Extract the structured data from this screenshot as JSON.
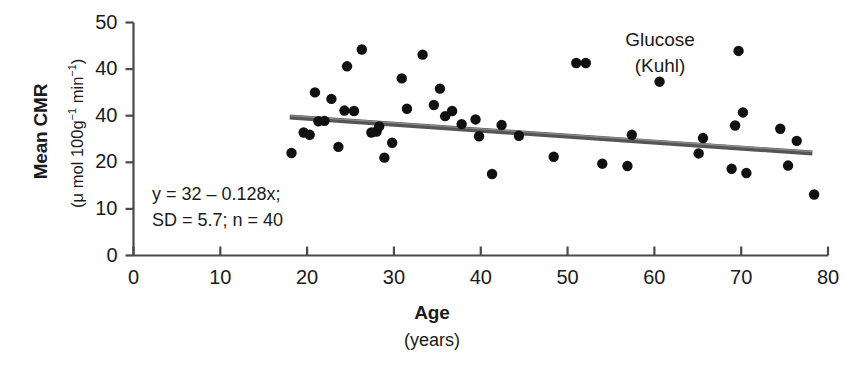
{
  "chart_data": {
    "type": "scatter",
    "title": "Glucose",
    "subtitle": "(Kuhl)",
    "xlabel": "Age",
    "xlabel_units": "(years)",
    "ylabel": "Mean CMR",
    "ylabel_units_prefix": "(μ mol 100g",
    "ylabel_units_sup1": "−1",
    "ylabel_units_mid": " min",
    "ylabel_units_sup2": "−1",
    "ylabel_units_suffix": ")",
    "xlim": [
      0,
      80
    ],
    "ylim": [
      0,
      50
    ],
    "xticks": [
      0,
      10,
      20,
      30,
      40,
      50,
      60,
      70,
      80
    ],
    "xtick_labels": [
      "0",
      "10",
      "20",
      "30",
      "40",
      "50",
      "60",
      "70",
      "80"
    ],
    "yticks": [
      0,
      10,
      20,
      30,
      40,
      50
    ],
    "ytick_labels": [
      "0",
      "10",
      "20",
      "40",
      "40",
      "50"
    ],
    "grid": false,
    "legend": "none",
    "marker_color": "#111111",
    "marker_size": 5.2,
    "axis_color": "#4a4a4a",
    "fit_line": {
      "label": "regression line",
      "color": "#555555",
      "width": 5,
      "x_start": 18,
      "x_end": 78.2,
      "y_start": 29.7,
      "y_end": 22.0
    },
    "annotations": {
      "equation": "y = 32 – 0.128x;",
      "statistics": "SD = 5.7; n = 40"
    },
    "n_points": 40,
    "points": [
      [
        18.2,
        22.0
      ],
      [
        19.6,
        26.4
      ],
      [
        20.3,
        25.9
      ],
      [
        20.9,
        35.0
      ],
      [
        21.3,
        28.8
      ],
      [
        22.0,
        28.9
      ],
      [
        22.8,
        33.6
      ],
      [
        23.6,
        23.3
      ],
      [
        24.3,
        31.1
      ],
      [
        24.6,
        40.6
      ],
      [
        25.4,
        31.0
      ],
      [
        26.3,
        44.2
      ],
      [
        27.4,
        26.4
      ],
      [
        28.0,
        26.6
      ],
      [
        28.3,
        27.7
      ],
      [
        28.9,
        21.0
      ],
      [
        29.8,
        24.2
      ],
      [
        30.9,
        38.0
      ],
      [
        31.5,
        31.5
      ],
      [
        33.3,
        43.1
      ],
      [
        34.6,
        32.3
      ],
      [
        35.3,
        35.8
      ],
      [
        35.9,
        29.9
      ],
      [
        36.7,
        31.0
      ],
      [
        37.8,
        28.2
      ],
      [
        39.4,
        29.2
      ],
      [
        39.8,
        25.6
      ],
      [
        41.3,
        17.5
      ],
      [
        42.4,
        28.0
      ],
      [
        44.4,
        25.7
      ],
      [
        48.4,
        21.2
      ],
      [
        51.0,
        41.3
      ],
      [
        52.1,
        41.3
      ],
      [
        54.0,
        19.7
      ],
      [
        56.9,
        19.2
      ],
      [
        57.4,
        25.9
      ],
      [
        60.6,
        37.3
      ],
      [
        65.1,
        21.9
      ],
      [
        65.6,
        25.2
      ],
      [
        68.9,
        18.6
      ],
      [
        69.3,
        27.9
      ],
      [
        69.7,
        43.9
      ],
      [
        70.2,
        30.7
      ],
      [
        70.6,
        17.7
      ],
      [
        74.5,
        27.2
      ],
      [
        75.4,
        19.3
      ],
      [
        76.4,
        24.6
      ],
      [
        78.4,
        13.1
      ]
    ]
  }
}
